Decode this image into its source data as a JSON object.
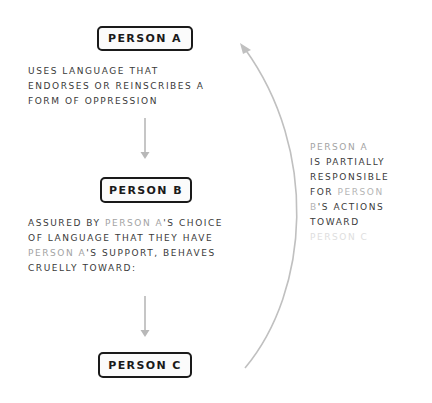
{
  "nodes": {
    "a": {
      "label": "PERSON A"
    },
    "b": {
      "label": "PERSON B"
    },
    "c": {
      "label": "PERSON C"
    }
  },
  "descriptions": {
    "a": {
      "lines": [
        "USES LANGUAGE THAT",
        "ENDORSES OR REINSCRIBES A",
        "FORM OF OPPRESSION"
      ]
    },
    "b": {
      "line1_prefix": "ASSURED BY ",
      "line1_highlight": "PERSON A",
      "line1_suffix": "'S CHOICE",
      "line2": "OF LANGUAGE THAT THEY HAVE",
      "line3_highlight": "PERSON A",
      "line3_suffix": "'S SUPPORT, BEHAVES",
      "line4": "CRUELLY TOWARD:"
    }
  },
  "side_note": {
    "line1_highlight": "PERSON A",
    "line2": "IS PARTIALLY",
    "line3": "RESPONSIBLE",
    "line4_prefix": "FOR ",
    "line4_highlight": "PERSON",
    "line5_highlight": "B",
    "line5_suffix": "'S ACTIONS",
    "line6": "TOWARD",
    "line7_highlight": "PERSON C"
  },
  "colors": {
    "text": "#3a3a3a",
    "box_border": "#1a1a1a",
    "arrow": "#b8b8b8",
    "person_a_highlight": "#a3a3a3",
    "person_b_highlight": "#b5b5b5",
    "person_c_highlight": "#dedede"
  },
  "edges": [
    {
      "from": "a",
      "to": "b",
      "style": "straight-arrow"
    },
    {
      "from": "b",
      "to": "c",
      "style": "straight-arrow"
    },
    {
      "from": "c",
      "to": "a",
      "style": "curved-arrow",
      "label": "side_note"
    }
  ]
}
